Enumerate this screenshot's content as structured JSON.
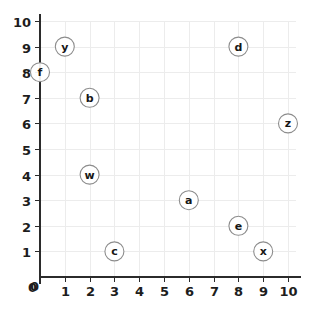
{
  "chart_data": {
    "type": "scatter",
    "title": "",
    "subtitle": "",
    "xlabel": "",
    "ylabel": "",
    "xlim": [
      0,
      10
    ],
    "ylim": [
      0,
      10
    ],
    "grid": true,
    "legend": false,
    "legend_position": "none",
    "x_ticks": [
      "0",
      "1",
      "2",
      "3",
      "4",
      "5",
      "6",
      "7",
      "8",
      "9",
      "10"
    ],
    "y_ticks": [
      "0",
      "1",
      "2",
      "3",
      "4",
      "5",
      "6",
      "7",
      "8",
      "9",
      "10"
    ],
    "marker_style": "circle-with-letter",
    "points": [
      {
        "label": "y",
        "x": 1,
        "y": 9
      },
      {
        "label": "f",
        "x": 0,
        "y": 8
      },
      {
        "label": "b",
        "x": 2,
        "y": 7
      },
      {
        "label": "w",
        "x": 2,
        "y": 4
      },
      {
        "label": "c",
        "x": 3,
        "y": 1
      },
      {
        "label": "d",
        "x": 8,
        "y": 9
      },
      {
        "label": "z",
        "x": 10,
        "y": 6
      },
      {
        "label": "a",
        "x": 6,
        "y": 3
      },
      {
        "label": "e",
        "x": 8,
        "y": 2
      },
      {
        "label": "x",
        "x": 9,
        "y": 1
      }
    ]
  },
  "colors": {
    "background": "#ffffff",
    "gridline": "#ececec",
    "axis": "#2b2b2b",
    "tick_label": "#1d1d1d",
    "marker_stroke": "#8c8c8c",
    "marker_fill": "#ffffff",
    "marker_label": "#161616"
  }
}
